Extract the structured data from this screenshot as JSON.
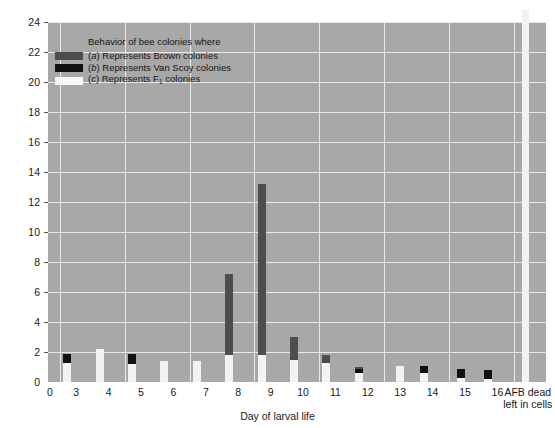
{
  "chart_data": {
    "type": "bar",
    "title": "",
    "xlabel": "Day of larval life",
    "ylabel": "Daily per cent removal",
    "ylim": [
      0,
      24
    ],
    "ytick_labels": [
      "0",
      "2",
      "4",
      "6",
      "8",
      "10",
      "12",
      "14",
      "16",
      "18",
      "20",
      "22",
      "24"
    ],
    "yticks": [
      0,
      2,
      4,
      6,
      8,
      10,
      12,
      14,
      16,
      18,
      20,
      22,
      24
    ],
    "categories": [
      "0",
      "3",
      "4",
      "5",
      "6",
      "7",
      "8",
      "9",
      "10",
      "11",
      "12",
      "13",
      "14",
      "15",
      "16",
      "AFB dead\nleft in cells"
    ],
    "grid": true,
    "legend_position": "upper-left",
    "series": [
      {
        "name": "(a) Represents Brown colonies",
        "key": "a",
        "color": "#4d4d4d",
        "values": [
          0.7,
          1.1,
          0.8,
          1.3,
          0.9,
          1.3,
          7.2,
          1.2,
          3.0,
          1.8,
          1.0,
          0.0,
          0.5,
          0.6,
          0.3,
          0.25
        ]
      },
      {
        "name": "(b) Represents Van Scoy colonies",
        "key": "b",
        "color": "#111111",
        "values": [
          1.9,
          1.8,
          1.9,
          1.0,
          0.7,
          1.3,
          13.2,
          0.9,
          0.6,
          0.9,
          0.0,
          1.1,
          0.9,
          0.8,
          19.4,
          0.0
        ]
      },
      {
        "name": "(c) Represents F1 colonies",
        "key": "c",
        "color": "#f2f2f2",
        "values": [
          1.3,
          2.2,
          1.2,
          1.4,
          1.4,
          1.8,
          1.8,
          1.5,
          1.3,
          0.6,
          1.1,
          0.6,
          0.3,
          0.2,
          25.5,
          0.0
        ]
      }
    ],
    "groups": [
      {
        "label": "3",
        "bars": [
          {
            "series": "a",
            "value": 0.7
          },
          {
            "series": "b",
            "value": 1.9
          },
          {
            "series": "c",
            "value": 1.3
          }
        ]
      },
      {
        "label": "4",
        "bars": [
          {
            "series": "a",
            "value": 1.1
          },
          {
            "series": "b",
            "value": 1.8
          },
          {
            "series": "c",
            "value": 2.2
          }
        ]
      },
      {
        "label": "5",
        "bars": [
          {
            "series": "a",
            "value": 0.8
          },
          {
            "series": "b",
            "value": 1.9
          },
          {
            "series": "c",
            "value": 1.2
          }
        ]
      },
      {
        "label": "6",
        "bars": [
          {
            "series": "a",
            "value": 1.3
          },
          {
            "series": "b",
            "value": 1.0
          },
          {
            "series": "c",
            "value": 1.4
          }
        ]
      },
      {
        "label": "7",
        "bars": [
          {
            "series": "a",
            "value": 0.9
          },
          {
            "series": "b",
            "value": 0.7
          },
          {
            "series": "c",
            "value": 1.4
          }
        ]
      },
      {
        "label": "8",
        "bars": [
          {
            "series": "a",
            "value": 7.2
          },
          {
            "series": "b",
            "value": 1.3
          },
          {
            "series": "c",
            "value": 1.8
          }
        ]
      },
      {
        "label": "9",
        "bars": [
          {
            "series": "a",
            "value": 13.2
          },
          {
            "series": "b",
            "value": 1.2
          },
          {
            "series": "c",
            "value": 1.8
          }
        ]
      },
      {
        "label": "10",
        "bars": [
          {
            "series": "a",
            "value": 3.0
          },
          {
            "series": "b",
            "value": 0.9
          },
          {
            "series": "c",
            "value": 1.5
          }
        ]
      },
      {
        "label": "11",
        "bars": [
          {
            "series": "a",
            "value": 1.8
          },
          {
            "series": "b",
            "value": 0.6
          },
          {
            "series": "c",
            "value": 1.3
          }
        ]
      },
      {
        "label": "12",
        "bars": [
          {
            "series": "a",
            "value": 1.0
          },
          {
            "series": "b",
            "value": 0.9
          },
          {
            "series": "c",
            "value": 0.6
          }
        ]
      },
      {
        "label": "13",
        "bars": [
          {
            "series": "c",
            "value": 1.1
          }
        ]
      },
      {
        "label": "14",
        "bars": [
          {
            "series": "a",
            "value": 0.5
          },
          {
            "series": "b",
            "value": 1.1
          },
          {
            "series": "c",
            "value": 0.6
          }
        ]
      },
      {
        "label": "15",
        "bars": [
          {
            "series": "b",
            "value": 0.9
          },
          {
            "series": "c",
            "value": 0.3
          }
        ]
      },
      {
        "label": "16",
        "bars": [
          {
            "series": "a",
            "value": 0.3
          },
          {
            "series": "b",
            "value": 0.8
          },
          {
            "series": "c",
            "value": 0.2
          }
        ]
      },
      {
        "label": "AFB dead left in cells",
        "bars": [
          {
            "series": "b",
            "value": 19.4
          },
          {
            "series": "c",
            "value": 25.5
          }
        ]
      }
    ]
  },
  "legend": {
    "title": "Behavior of bee colonies where",
    "entries": [
      {
        "key": "a",
        "prefix": "(",
        "letter": "a",
        "suffix": ") Represents Brown colonies"
      },
      {
        "key": "b",
        "prefix": "(",
        "letter": "b",
        "suffix": ") Represents Van Scoy colonies"
      },
      {
        "key": "c",
        "prefix": "(",
        "letter": "c",
        "suffix": ") Represents F",
        "subscript": "1",
        "tail": " colonies"
      }
    ]
  },
  "axis": {
    "x_title": "Day of larval life",
    "y_title": "Daily per cent removal",
    "x_special_label_line1": "AFB dead",
    "x_special_label_line2": "left in cells",
    "origin_label": "0"
  },
  "colors": {
    "plot_background": "#a8a8a8",
    "grid": "#e9e9e9",
    "series_a": "#4d4d4d",
    "series_b": "#111111",
    "series_c": "#f2f2f2",
    "page_background": "#ffffff",
    "text": "#1a1a1a"
  }
}
